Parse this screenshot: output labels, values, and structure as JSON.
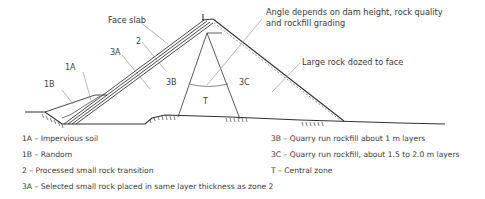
{
  "diagram": {
    "annotations": {
      "face_slab": "Face slab",
      "angle_line1": "Angle depends on dam height, rock quality",
      "angle_line2": "and rockfill grading",
      "large_rock": "Large rock dozed to face"
    },
    "zone_labels": {
      "z1A": "1A",
      "z1B": "1B",
      "z2": "2",
      "z3A": "3A",
      "z3B": "3B",
      "z3C": "3C",
      "zT": "T"
    },
    "colors": {
      "line": "#333333",
      "leader": "#9a9a9a",
      "text": "#3a3a3a"
    }
  },
  "legend": {
    "left": [
      "1A –  Impervious soil",
      "1B – Random",
      " 2 – Processed small rock transition",
      "3A – Selected small rock placed in same layer thickness as zone 2"
    ],
    "right": [
      "3B – Quarry run rockfill  about 1 m layers",
      "3C – Quarry run rockfill, about 1.5 to 2.0 m layers",
      "T  – Central zone"
    ]
  }
}
